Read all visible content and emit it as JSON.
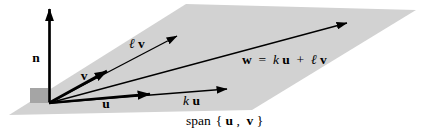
{
  "figure": {
    "ink": "#000000",
    "plane_fill": "#d2d2d2",
    "origin_marker_fill": "#a5a5a5",
    "labels": {
      "n": "n",
      "v": "v",
      "u": "u",
      "k": "k",
      "ell": "ℓ",
      "w": "w",
      "equals": " = ",
      "plus": " + ",
      "span_word": "span",
      "brace_open": "{",
      "comma": ", ",
      "brace_close": "}"
    }
  }
}
